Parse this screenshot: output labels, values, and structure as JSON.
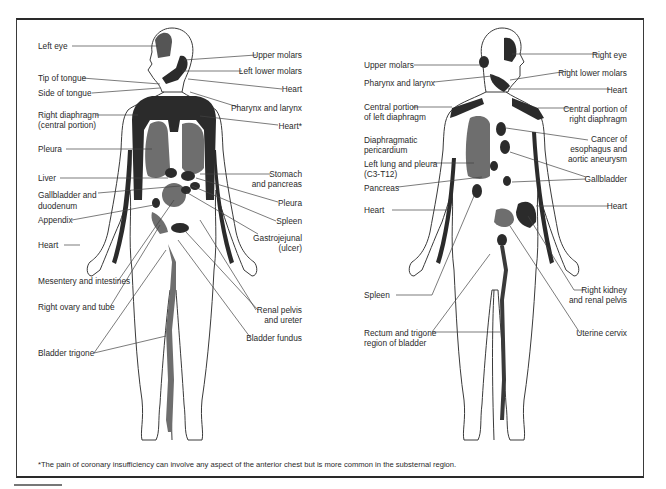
{
  "figure": {
    "anterior_view": {
      "left_labels": [
        {
          "id": "left-eye",
          "text": "Left eye"
        },
        {
          "id": "tip-of-tongue",
          "text": "Tip of tongue"
        },
        {
          "id": "side-of-tongue",
          "text": "Side of tongue"
        },
        {
          "id": "right-diaphragm-l1",
          "text": "Right diaphragm"
        },
        {
          "id": "right-diaphragm-l2",
          "text": "(central portion)"
        },
        {
          "id": "pleura",
          "text": "Pleura"
        },
        {
          "id": "liver",
          "text": "Liver"
        },
        {
          "id": "gallbladder-l1",
          "text": "Gallbladder and"
        },
        {
          "id": "gallbladder-l2",
          "text": "duodenum"
        },
        {
          "id": "appendix",
          "text": "Appendix"
        },
        {
          "id": "heart",
          "text": "Heart"
        },
        {
          "id": "mesentery",
          "text": "Mesentery and intestines"
        },
        {
          "id": "right-ovary",
          "text": "Right ovary and tube"
        },
        {
          "id": "bladder-trigone",
          "text": "Bladder trigone"
        }
      ],
      "right_labels": [
        {
          "id": "upper-molars",
          "text": "Upper molars"
        },
        {
          "id": "left-lower-molars",
          "text": "Left lower molars"
        },
        {
          "id": "heart",
          "text": "Heart"
        },
        {
          "id": "pharynx-larynx",
          "text": "Pharynx and larynx"
        },
        {
          "id": "heart-star",
          "text": "Heart*"
        },
        {
          "id": "stomach-l1",
          "text": "Stomach"
        },
        {
          "id": "stomach-l2",
          "text": "and pancreas"
        },
        {
          "id": "pleura",
          "text": "Pleura"
        },
        {
          "id": "spleen",
          "text": "Spleen"
        },
        {
          "id": "gastrojejunal-l1",
          "text": "Gastrojejunal"
        },
        {
          "id": "gastrojejunal-l2",
          "text": "(ulcer)"
        },
        {
          "id": "renal-l1",
          "text": "Renal pelvis"
        },
        {
          "id": "renal-l2",
          "text": "and ureter"
        },
        {
          "id": "bladder-fundus",
          "text": "Bladder fundus"
        }
      ]
    },
    "posterior_view": {
      "left_labels": [
        {
          "id": "upper-molars",
          "text": "Upper molars"
        },
        {
          "id": "pharynx-larynx",
          "text": "Pharynx and larynx"
        },
        {
          "id": "central-left-l1",
          "text": "Central portion"
        },
        {
          "id": "central-left-l2",
          "text": "of left diaphragm"
        },
        {
          "id": "diaphragmatic-l1",
          "text": "Diaphragmatic"
        },
        {
          "id": "diaphragmatic-l2",
          "text": "pericardium"
        },
        {
          "id": "left-lung-l1",
          "text": "Left lung and pleura"
        },
        {
          "id": "left-lung-l2",
          "text": "(C3-T12)"
        },
        {
          "id": "pancreas",
          "text": "Pancreas"
        },
        {
          "id": "heart",
          "text": "Heart"
        },
        {
          "id": "spleen",
          "text": "Spleen"
        },
        {
          "id": "rectum-l1",
          "text": "Rectum and trigone"
        },
        {
          "id": "rectum-l2",
          "text": "region of bladder"
        }
      ],
      "right_labels": [
        {
          "id": "right-eye",
          "text": "Right eye"
        },
        {
          "id": "right-lower-molars",
          "text": "Right lower molars"
        },
        {
          "id": "heart",
          "text": "Heart"
        },
        {
          "id": "central-right-l1",
          "text": "Central portion of"
        },
        {
          "id": "central-right-l2",
          "text": "right diaphragm"
        },
        {
          "id": "cancer-l1",
          "text": "Cancer of"
        },
        {
          "id": "cancer-l2",
          "text": "esophagus and"
        },
        {
          "id": "cancer-l3",
          "text": "aortic aneurysm"
        },
        {
          "id": "gallbladder",
          "text": "Gallbladder"
        },
        {
          "id": "heart2",
          "text": "Heart"
        },
        {
          "id": "right-kidney-l1",
          "text": "Right kidney"
        },
        {
          "id": "right-kidney-l2",
          "text": "and renal pelvis"
        },
        {
          "id": "uterine-cervix",
          "text": "Uterine cervix"
        }
      ]
    },
    "footnote": "*The pain of coronary insufficiency can involve any aspect of the anterior chest but is more common in the substernal region.",
    "colors": {
      "dark_region": "#2b2b2b",
      "mid_region": "#6e6e6e",
      "outline": "#3a3a3a",
      "line": "#444444"
    }
  }
}
